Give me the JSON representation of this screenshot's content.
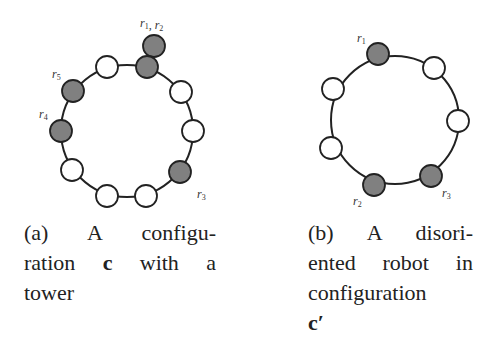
{
  "colors": {
    "robot": "#808080",
    "empty": "#ffffff",
    "stroke": "#222222",
    "ring": "#222222"
  },
  "figure_a": {
    "ring": {
      "cx": 127,
      "cy": 131,
      "r": 66
    },
    "nodes": [
      {
        "id": "a-n1",
        "x": 147,
        "y": 67,
        "occupied": true
      },
      {
        "id": "a-n2",
        "x": 181,
        "y": 92,
        "occupied": false
      },
      {
        "id": "a-n3",
        "x": 193,
        "y": 131,
        "occupied": false
      },
      {
        "id": "a-n4",
        "x": 180,
        "y": 172,
        "occupied": true
      },
      {
        "id": "a-n5",
        "x": 146,
        "y": 196,
        "occupied": false
      },
      {
        "id": "a-n6",
        "x": 107,
        "y": 196,
        "occupied": false
      },
      {
        "id": "a-n7",
        "x": 72,
        "y": 170,
        "occupied": false
      },
      {
        "id": "a-n8",
        "x": 61,
        "y": 131,
        "occupied": true
      },
      {
        "id": "a-n9",
        "x": 73,
        "y": 91,
        "occupied": true
      },
      {
        "id": "a-n10",
        "x": 107,
        "y": 67,
        "occupied": false
      }
    ],
    "tower_extra": {
      "x": 154,
      "y": 46
    },
    "labels": [
      {
        "text": "r1, r2",
        "x": 140,
        "y": 27
      },
      {
        "text": "r5",
        "x": 52,
        "y": 78
      },
      {
        "text": "r4",
        "x": 39,
        "y": 118
      },
      {
        "text": "r3",
        "x": 197,
        "y": 198
      }
    ],
    "caption": {
      "lines": [
        [
          "(a)",
          "A",
          "configu-"
        ],
        [
          "ration",
          "c",
          "with",
          "a"
        ],
        [
          "tower"
        ]
      ]
    }
  },
  "figure_b": {
    "ring": {
      "cx": 395,
      "cy": 120,
      "r": 64
    },
    "nodes": [
      {
        "id": "b-n1",
        "x": 378,
        "y": 54,
        "occupied": true
      },
      {
        "id": "b-n2",
        "x": 434,
        "y": 68,
        "occupied": false
      },
      {
        "id": "b-n3",
        "x": 458,
        "y": 121,
        "occupied": false
      },
      {
        "id": "b-n4",
        "x": 431,
        "y": 176,
        "occupied": true
      },
      {
        "id": "b-n5",
        "x": 374,
        "y": 185,
        "occupied": true
      },
      {
        "id": "b-n6",
        "x": 331,
        "y": 148,
        "occupied": false
      },
      {
        "id": "b-n7",
        "x": 333,
        "y": 89,
        "occupied": false
      }
    ],
    "labels": [
      {
        "text": "r1",
        "x": 357,
        "y": 42
      },
      {
        "text": "r3",
        "x": 442,
        "y": 197
      },
      {
        "text": "r2",
        "x": 353,
        "y": 205
      }
    ],
    "caption": {
      "lines": [
        [
          "(b)",
          "A",
          "disori-"
        ],
        [
          "ented",
          "robot",
          "in"
        ],
        [
          "configuration"
        ],
        [
          "c′"
        ]
      ]
    }
  }
}
